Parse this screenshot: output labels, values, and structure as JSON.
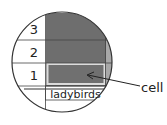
{
  "diagram": {
    "type": "magnified-bar-chart-cell",
    "row_labels": [
      "3",
      "2",
      "1"
    ],
    "category_label": "ladybirds",
    "callout_label": "cell",
    "colors": {
      "bar_fill": "#6e6e6e",
      "adjacent_bar_fill": "#a8a8a8",
      "highlight_border": "#d9d9d9",
      "grid_line": "#444444",
      "circle_outline": "#333333",
      "background": "#ffffff"
    }
  }
}
